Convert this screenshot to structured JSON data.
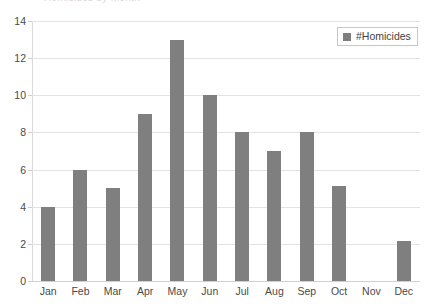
{
  "title_fragment": "Homicides by Month",
  "legend": {
    "position": "top-right-inside",
    "entries": [
      {
        "label": "#Homicides",
        "color": "#7f7f7f",
        "marker": "square-swatch-icon"
      }
    ]
  },
  "axes": {
    "y_ticks": [
      "0",
      "2",
      "4",
      "6",
      "8",
      "10",
      "12",
      "14"
    ],
    "x_ticks": [
      "Jan",
      "Feb",
      "Mar",
      "Apr",
      "May",
      "Jun",
      "Jul",
      "Aug",
      "Sep",
      "Oct",
      "Nov",
      "Dec"
    ]
  },
  "colors": {
    "bar": "#7f7f7f",
    "grid": "#e3e3e3",
    "axis": "#d9d9d9",
    "text": "#4a4a4a",
    "background": "#ffffff",
    "legend_border": "#c8c8c8"
  },
  "chart_data": {
    "type": "bar",
    "title": "Homicides by Month",
    "xlabel": "",
    "ylabel": "",
    "ylim": [
      0,
      14
    ],
    "ytick_step": 2,
    "grid": true,
    "legend_position": "upper right",
    "categories": [
      "Jan",
      "Feb",
      "Mar",
      "Apr",
      "May",
      "Jun",
      "Jul",
      "Aug",
      "Sep",
      "Oct",
      "Nov",
      "Dec"
    ],
    "series": [
      {
        "name": "#Homicides",
        "color": "#7f7f7f",
        "values": [
          4,
          6,
          5,
          9,
          13,
          10,
          8,
          7,
          8,
          5.1,
          0,
          2.15
        ]
      }
    ]
  }
}
